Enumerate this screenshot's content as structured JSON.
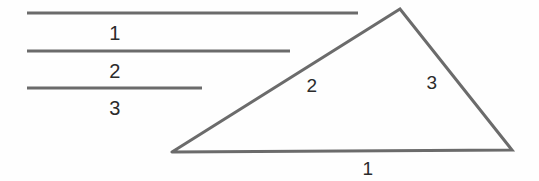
{
  "figure": {
    "background_color": "#fefefe",
    "stroke_color": "#6b6b6b",
    "label_color": "#2b2b2b",
    "width": 539,
    "height": 181
  },
  "segments": [
    {
      "label": "1",
      "x1": 27,
      "y1": 13,
      "x2": 358,
      "y2": 13,
      "length": 331,
      "label_x": 115,
      "label_y": 33
    },
    {
      "label": "2",
      "x1": 27,
      "y1": 51,
      "x2": 290,
      "y2": 51,
      "length": 263,
      "label_x": 115,
      "label_y": 71
    },
    {
      "label": "3",
      "x1": 27,
      "y1": 88,
      "x2": 202,
      "y2": 88,
      "length": 175,
      "label_x": 115,
      "label_y": 108
    }
  ],
  "triangle": {
    "vertices": {
      "bottom_left": {
        "x": 172,
        "y": 152
      },
      "apex": {
        "x": 400,
        "y": 9
      },
      "bottom_right": {
        "x": 512,
        "y": 150
      }
    },
    "points_attr": "172,152 400,9 512,150 172,152",
    "sides": [
      {
        "label": "1",
        "from": "bottom_left",
        "to": "bottom_right",
        "label_x": 368,
        "label_y": 168
      },
      {
        "label": "2",
        "from": "bottom_left",
        "to": "apex",
        "label_x": 312,
        "label_y": 85
      },
      {
        "label": "3",
        "from": "apex",
        "to": "bottom_right",
        "label_x": 432,
        "label_y": 82
      }
    ]
  }
}
